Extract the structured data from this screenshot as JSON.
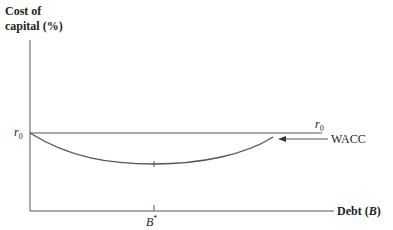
{
  "diagram": {
    "y_axis_label_line1": "Cost of",
    "y_axis_label_line2": "capital (%)",
    "x_axis_label": "Debt (B)",
    "x_axis_label_prefix": "Debt (",
    "x_axis_label_var": "B",
    "x_axis_label_suffix": ")",
    "r0_left_label": "r",
    "r0_left_sub": "0",
    "r0_right_label": "r",
    "r0_right_sub": "0",
    "wacc_label": "WACC",
    "bstar_label": "B*",
    "bstar_var": "B",
    "bstar_sup": "*"
  }
}
